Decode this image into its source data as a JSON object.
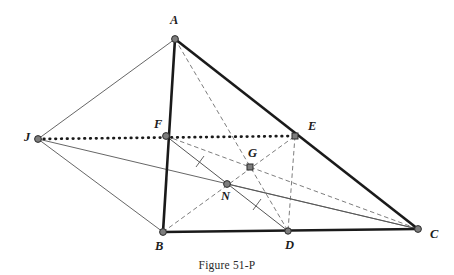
{
  "figure": {
    "caption": "Figure 51-P",
    "type": "euclidean-geometry-diagram",
    "colors": {
      "stroke_dark": "#1a1a1a",
      "stroke_thin": "#555555",
      "stroke_dashed": "#6e6e6e",
      "vertex_fill": "#7d7d7d",
      "vertex_stroke": "#2b2b2b",
      "label_color": "#1c1c1c",
      "background": "#ffffff"
    },
    "points": [
      {
        "id": "A",
        "label": "A",
        "x": 175,
        "y": 39,
        "label_x": 170,
        "label_y": 14,
        "marker": "circle"
      },
      {
        "id": "B",
        "label": "B",
        "x": 163,
        "y": 232,
        "label_x": 155,
        "label_y": 240,
        "marker": "circle"
      },
      {
        "id": "C",
        "label": "C",
        "x": 418,
        "y": 229,
        "label_x": 430,
        "label_y": 228,
        "marker": "circle"
      },
      {
        "id": "D",
        "label": "D",
        "x": 288,
        "y": 231,
        "label_x": 285,
        "label_y": 239,
        "marker": "circle"
      },
      {
        "id": "E",
        "label": "E",
        "x": 295,
        "y": 136,
        "label_x": 308,
        "label_y": 120,
        "marker": "square"
      },
      {
        "id": "F",
        "label": "F",
        "x": 166,
        "y": 136,
        "label_x": 154,
        "label_y": 118,
        "marker": "circle"
      },
      {
        "id": "G",
        "label": "G",
        "x": 250,
        "y": 167,
        "label_x": 248,
        "label_y": 147,
        "marker": "square"
      },
      {
        "id": "N",
        "label": "N",
        "x": 227,
        "y": 184,
        "label_x": 221,
        "label_y": 190,
        "marker": "circle"
      },
      {
        "id": "J",
        "label": "J",
        "x": 38,
        "y": 139,
        "label_x": 24,
        "label_y": 131,
        "marker": "circle"
      }
    ],
    "segments": [
      {
        "id": "AB",
        "from": "A",
        "to": "B",
        "style": "solid",
        "weight": "thick",
        "name": "segment-ab"
      },
      {
        "id": "AC",
        "from": "A",
        "to": "C",
        "style": "solid",
        "weight": "thick",
        "name": "segment-ac"
      },
      {
        "id": "BC",
        "from": "B",
        "to": "C",
        "style": "solid",
        "weight": "thick",
        "name": "segment-bc"
      },
      {
        "id": "JA",
        "from": "J",
        "to": "A",
        "style": "solid",
        "weight": "thin",
        "name": "segment-ja"
      },
      {
        "id": "JB",
        "from": "J",
        "to": "B",
        "style": "solid",
        "weight": "thin",
        "name": "segment-jb"
      },
      {
        "id": "JC",
        "from": "J",
        "to": "C",
        "style": "solid",
        "weight": "thin",
        "name": "segment-jc"
      },
      {
        "id": "JE",
        "from": "J",
        "to": "E",
        "style": "dotted",
        "weight": "thick",
        "name": "segment-je"
      },
      {
        "id": "FD",
        "from": "F",
        "to": "D",
        "style": "solid",
        "weight": "thin",
        "name": "segment-fd"
      },
      {
        "id": "DC",
        "from": "D",
        "to": "C",
        "style": "solid",
        "weight": "thin",
        "name": "segment-dc-overlay"
      },
      {
        "id": "AD",
        "from": "A",
        "to": "D",
        "style": "dashed",
        "weight": "thin",
        "name": "segment-ad-median"
      },
      {
        "id": "BE",
        "from": "B",
        "to": "E",
        "style": "dashed",
        "weight": "thin",
        "name": "segment-be-median"
      },
      {
        "id": "FC",
        "from": "F",
        "to": "C",
        "style": "dashed",
        "weight": "thin",
        "name": "segment-fc-median"
      },
      {
        "id": "FB",
        "from": "F",
        "to": "B",
        "style": "solid",
        "weight": "thick",
        "name": "segment-fb"
      },
      {
        "id": "ED",
        "from": "E",
        "to": "D",
        "style": "dashed",
        "weight": "thin",
        "name": "segment-ed"
      },
      {
        "id": "NC",
        "from": "N",
        "to": "C",
        "style": "solid",
        "weight": "thin",
        "name": "segment-nc"
      }
    ],
    "tick_marks": [
      {
        "id": "tick-fn",
        "on_segment": "FN",
        "x": 200,
        "y": 162,
        "name": "tick-mark-fn"
      },
      {
        "id": "tick-nd",
        "on_segment": "ND",
        "x": 257,
        "y": 205,
        "name": "tick-mark-nd"
      }
    ],
    "labels_order": [
      "A",
      "F",
      "E",
      "J",
      "G",
      "N",
      "B",
      "D",
      "C"
    ]
  }
}
